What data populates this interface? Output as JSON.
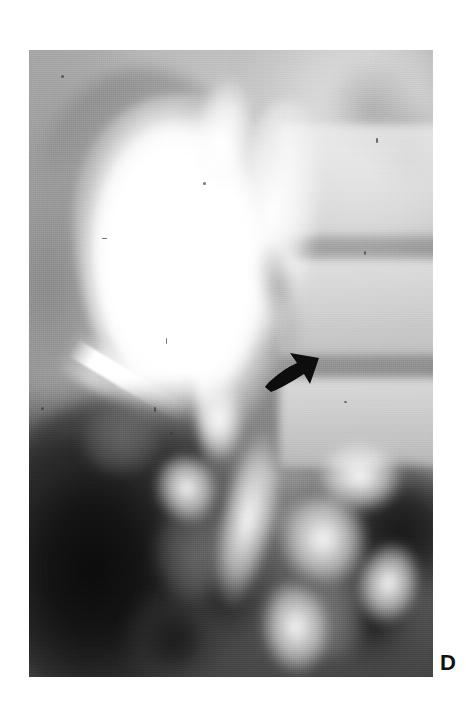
{
  "figure": {
    "panel_label": "D",
    "modality": "radiograph",
    "background_color": "#ffffff"
  },
  "radiograph": {
    "frame": {
      "left_px": 29,
      "top_px": 50,
      "width_px": 404,
      "height_px": 627
    },
    "tones": {
      "film_light": "#e8e8e8",
      "film_mid": "#b4b4b4",
      "film_dark": "#151515",
      "contrast_white": "#ffffff",
      "soft_tissue_gray": "#9a9a9a"
    },
    "structures": [
      {
        "name": "contrast-filled-cavity",
        "description": "bright opacified pear-shaped structure, upper left-of-center"
      },
      {
        "name": "contrast-neck",
        "description": "narrowed superior neck of opacified structure"
      },
      {
        "name": "filling-defect",
        "description": "gray intraluminal defect along right margin of contrast"
      },
      {
        "name": "catheter",
        "description": "bright linear catheter coursing inferolaterally to the left"
      },
      {
        "name": "vertebral-bodies",
        "description": "stacked vertebral bodies with intervening disc spaces, right side"
      },
      {
        "name": "bowel-gas-lower-left",
        "description": "large dark gas collection, lower left quadrant"
      },
      {
        "name": "bowel-gas-lower-right",
        "description": "dark gas shadows, lower right"
      }
    ]
  },
  "annotations": {
    "arrow": {
      "name": "arrow-marker",
      "color": "#0d0d0d",
      "direction": "up-right",
      "tip_x_px": 318,
      "tip_y_px": 356,
      "tail_x_px": 266,
      "tail_y_px": 387
    }
  }
}
